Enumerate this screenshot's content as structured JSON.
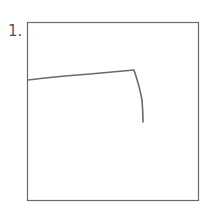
{
  "item": {
    "number_label": "1.",
    "stroke_color": "#6b6b6b",
    "frame_color": "#6b6b6b"
  }
}
